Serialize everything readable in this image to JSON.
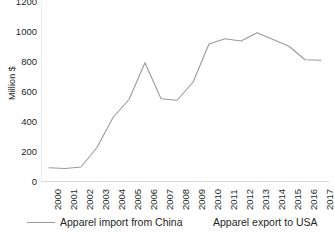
{
  "chart_data": {
    "type": "line",
    "title": "",
    "xlabel": "",
    "ylabel": "Million $",
    "ylim": [
      0,
      1200
    ],
    "yticks": [
      0,
      200,
      400,
      600,
      800,
      1000,
      1200
    ],
    "ytick_labels": [
      "0",
      "200",
      "400",
      "600",
      "800",
      "1000",
      "1200"
    ],
    "grid": false,
    "legend_position": "bottom",
    "line_color": "#9a9a9a",
    "categories": [
      "2000",
      "2001",
      "2002",
      "2003",
      "2004",
      "2005",
      "2006",
      "2007",
      "2008",
      "2009",
      "2010",
      "2011",
      "2012",
      "2013",
      "2014",
      "2015",
      "2016",
      "2017"
    ],
    "x": [
      2000,
      2001,
      2002,
      2003,
      2004,
      2005,
      2006,
      2007,
      2008,
      2009,
      2010,
      2011,
      2012,
      2013,
      2014,
      2015,
      2016,
      2017
    ],
    "series": [
      {
        "name": "Apparel import from China",
        "values": [
          95,
          90,
          100,
          230,
          430,
          550,
          795,
          555,
          545,
          665,
          920,
          955,
          940,
          995,
          950,
          905,
          815,
          812
        ]
      }
    ],
    "legend": [
      {
        "label": "Apparel import from China",
        "has_line_marker": true
      },
      {
        "label": "Apparel export to USA",
        "has_line_marker": false
      }
    ]
  }
}
